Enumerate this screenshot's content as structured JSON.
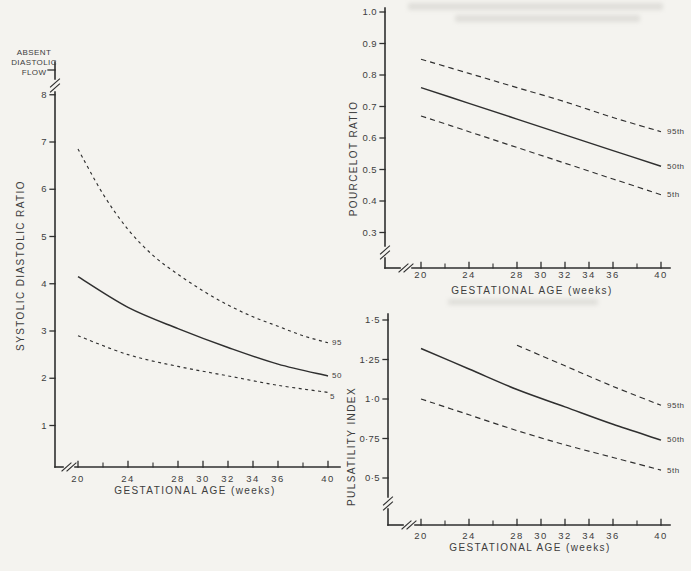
{
  "page": {
    "background": "#f4f3ef",
    "ink": "#2f2f2f",
    "text_color": "#3d3d3d"
  },
  "chart_data": [
    {
      "id": "systolic-diastolic-ratio",
      "type": "line",
      "xlabel": "GESTATIONAL AGE (weeks)",
      "ylabel": "SYSTOLIC DIASTOLIC RATIO",
      "annotation": [
        "ABSENT",
        "DIASTOLIC",
        "FLOW"
      ],
      "xlim": [
        20,
        40
      ],
      "ylim": [
        1,
        8
      ],
      "x_tick_values": [
        20,
        24,
        28,
        30,
        32,
        34,
        36,
        40
      ],
      "x_tick_labels": [
        "20",
        "24",
        "28",
        "30",
        "32",
        "34",
        "36",
        "40"
      ],
      "x_minor_ticks": [
        22,
        26,
        38
      ],
      "y_tick_values": [
        8,
        7,
        6,
        5,
        4,
        3,
        2,
        1
      ],
      "y_tick_labels": [
        "8",
        "7",
        "6",
        "5",
        "4",
        "3",
        "2",
        "1"
      ],
      "axis_breaks": {
        "y_axis": true,
        "x_axis": true
      },
      "legend_position": "right-end-of-lines",
      "grid": false,
      "series": [
        {
          "name": "95",
          "style": "dashed",
          "x": [
            20,
            22,
            24,
            26,
            28,
            30,
            32,
            34,
            36,
            38,
            40
          ],
          "y": [
            6.85,
            5.9,
            5.15,
            4.6,
            4.2,
            3.85,
            3.55,
            3.3,
            3.1,
            2.9,
            2.75
          ]
        },
        {
          "name": "50",
          "style": "solid",
          "x": [
            20,
            24,
            28,
            32,
            36,
            40
          ],
          "y": [
            4.15,
            3.5,
            3.05,
            2.65,
            2.3,
            2.05
          ]
        },
        {
          "name": "5",
          "style": "dashed",
          "x": [
            20,
            24,
            28,
            32,
            36,
            40
          ],
          "y": [
            2.9,
            2.5,
            2.25,
            2.05,
            1.85,
            1.7
          ]
        }
      ]
    },
    {
      "id": "pourcelot-ratio",
      "type": "line",
      "xlabel": "GESTATIONAL AGE (weeks)",
      "ylabel": "POURCELOT RATIO",
      "xlim": [
        20,
        40
      ],
      "ylim": [
        0.3,
        1.0
      ],
      "x_tick_values": [
        20,
        24,
        28,
        30,
        32,
        34,
        36,
        40
      ],
      "x_tick_labels": [
        "20",
        "24",
        "28",
        "30",
        "32",
        "34",
        "36",
        "40"
      ],
      "x_minor_ticks": [
        22,
        26,
        38
      ],
      "y_tick_values": [
        1.0,
        0.9,
        0.8,
        0.7,
        0.6,
        0.5,
        0.4,
        0.3
      ],
      "y_tick_labels": [
        "1.0",
        "0.9",
        "0.8",
        "0.7",
        "0.6",
        "0.5",
        "0.4",
        "0.3"
      ],
      "axis_breaks": {
        "y_axis": true,
        "x_axis": true
      },
      "legend_position": "right-end-of-lines",
      "grid": false,
      "series": [
        {
          "name": "95th",
          "style": "dashed",
          "x": [
            20,
            24,
            28,
            32,
            36,
            40
          ],
          "y": [
            0.85,
            0.805,
            0.76,
            0.715,
            0.665,
            0.62
          ]
        },
        {
          "name": "50th",
          "style": "solid",
          "x": [
            20,
            24,
            28,
            32,
            36,
            40
          ],
          "y": [
            0.76,
            0.71,
            0.66,
            0.61,
            0.56,
            0.51
          ]
        },
        {
          "name": "5th",
          "style": "dashed",
          "x": [
            20,
            24,
            28,
            32,
            36,
            40
          ],
          "y": [
            0.67,
            0.62,
            0.57,
            0.52,
            0.47,
            0.42
          ]
        }
      ]
    },
    {
      "id": "pulsatility-index",
      "type": "line",
      "xlabel": "GESTATIONAL AGE (weeks)",
      "ylabel": "PULSATILITY INDEX",
      "xlim": [
        20,
        40
      ],
      "ylim": [
        0.5,
        1.5
      ],
      "x_tick_values": [
        20,
        24,
        28,
        30,
        32,
        34,
        36,
        40
      ],
      "x_tick_labels": [
        "20",
        "24",
        "28",
        "30",
        "32",
        "34",
        "36",
        "40"
      ],
      "x_minor_ticks": [
        22,
        26,
        38
      ],
      "y_tick_values": [
        1.5,
        1.25,
        1.0,
        0.75,
        0.5
      ],
      "y_tick_labels": [
        "1·5",
        "1·25",
        "1·0",
        "0·75",
        "0·5"
      ],
      "axis_breaks": {
        "y_axis": true,
        "x_axis": true
      },
      "legend_position": "right-end-of-lines",
      "grid": false,
      "series": [
        {
          "name": "95th",
          "style": "dashed",
          "x": [
            28,
            32,
            36,
            40
          ],
          "y": [
            1.34,
            1.21,
            1.08,
            0.96
          ]
        },
        {
          "name": "50th",
          "style": "solid",
          "x": [
            20,
            24,
            28,
            32,
            36,
            40
          ],
          "y": [
            1.32,
            1.19,
            1.06,
            0.95,
            0.84,
            0.74
          ]
        },
        {
          "name": "5th",
          "style": "dashed",
          "x": [
            20,
            24,
            28,
            32,
            36,
            40
          ],
          "y": [
            1.0,
            0.9,
            0.8,
            0.71,
            0.63,
            0.55
          ]
        }
      ]
    }
  ]
}
